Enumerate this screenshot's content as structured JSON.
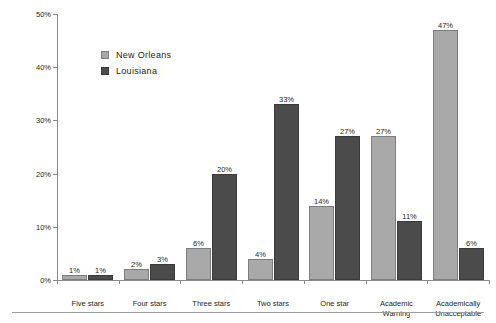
{
  "chart_data": {
    "type": "bar",
    "title": "",
    "xlabel": "",
    "ylabel": "",
    "ylim": [
      0,
      50
    ],
    "ytick_labels": [
      "0%",
      "10%",
      "20%",
      "30%",
      "40%",
      "50%"
    ],
    "ytick_values": [
      0,
      10,
      20,
      30,
      40,
      50
    ],
    "grid": false,
    "legend_position": "upper-left-inside",
    "categories": [
      "Five stars",
      "Four stars",
      "Three stars",
      "Two stars",
      "One star",
      "Academic\nWarning",
      "Academically\nUnacceptable"
    ],
    "series": [
      {
        "name": "New Orleans",
        "color": "#a9a9a9",
        "values": [
          1,
          2,
          6,
          4,
          14,
          27,
          47
        ],
        "labels": [
          "1%",
          "2%",
          "6%",
          "4%",
          "14%",
          "27%",
          "47%"
        ]
      },
      {
        "name": "Louisiana",
        "color": "#4b4b4b",
        "values": [
          1,
          3,
          20,
          33,
          27,
          11,
          6
        ],
        "labels": [
          "1%",
          "3%",
          "20%",
          "33%",
          "27%",
          "11%",
          "6%"
        ]
      }
    ]
  },
  "legend": {
    "items": [
      {
        "label": "New Orleans"
      },
      {
        "label": "Louisiana"
      }
    ]
  },
  "colors": {
    "series_new_orleans": "#a9a9a9",
    "series_louisiana": "#4b4b4b",
    "axis": "#8b8b8b",
    "text": "#231f20",
    "rule": "#9c9c9c",
    "background": "#ffffff"
  }
}
